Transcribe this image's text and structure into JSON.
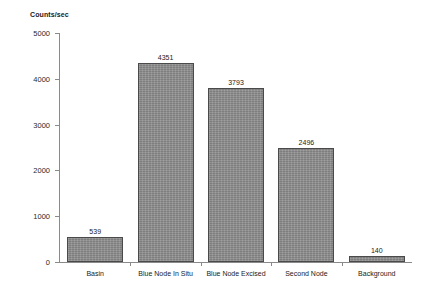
{
  "chart_data": {
    "type": "bar",
    "title": "",
    "xlabel": "",
    "ylabel": "Counts/sec",
    "categories": [
      "Basin",
      "Blue Node In Situ",
      "Blue Node Excised",
      "Second Node",
      "Background"
    ],
    "values": [
      539,
      4351,
      3793,
      2496,
      140
    ],
    "value_labels": [
      "539",
      "4351",
      "3793",
      "2496",
      "140"
    ],
    "ylim": [
      0,
      5000
    ],
    "ytick_labels": [
      "0",
      "1000",
      "2000",
      "3000",
      "4000",
      "5000"
    ],
    "ytick_values": [
      0,
      1000,
      2000,
      3000,
      4000,
      5000
    ],
    "grid": false,
    "legend": false,
    "bar_color": "#8d8d8d",
    "bar_border_color": "#4a4a4a",
    "axis_color": "#8a8a8a",
    "text_color": "#1a1a1a"
  }
}
